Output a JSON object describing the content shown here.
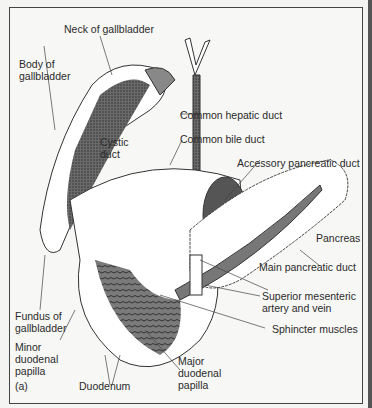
{
  "figure": {
    "panel_label": "(a)",
    "labels": {
      "neck": "Neck of gallbladder",
      "body": "Body of\ngallbladder",
      "cystic": "Cystic\nduct",
      "hepatic": "Common hepatic duct",
      "bile": "Common bile duct",
      "accessory": "Accessory pancreatic duct",
      "pancreas": "Pancreas",
      "main_duct": "Main pancreatic duct",
      "sma": "Superior mesenteric\nartery and vein",
      "sphincter": "Sphincter muscles",
      "fundus": "Fundus of\ngallbladder",
      "minor": "Minor\nduodenal\npapilla",
      "major": "Major\nduodenal\npapilla",
      "duodenum": "Duodenum"
    }
  }
}
